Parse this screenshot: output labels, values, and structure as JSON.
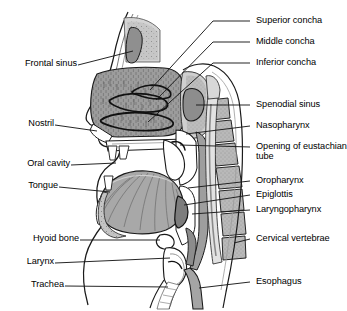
{
  "figure": {
    "type": "anatomical-diagram",
    "colors": {
      "background": "#ffffff",
      "outline": "#1a1a1a",
      "tissue_mid": "#9a9a9a",
      "tissue_dark": "#6e6e6e",
      "tissue_light": "#c8c8c8",
      "cavity_white": "#ffffff",
      "bone_stipple": "#b4b4b4",
      "label_text": "#000000",
      "leader_line": "#1a1a1a"
    }
  },
  "labels": {
    "left": [
      {
        "id": "frontal-sinus",
        "text": "Frontal sinus",
        "x": 14,
        "y": 62
      },
      {
        "id": "nostril",
        "text": "Nostril",
        "x": 14,
        "y": 122
      },
      {
        "id": "oral-cavity",
        "text": "Oral cavity",
        "x": 14,
        "y": 162
      },
      {
        "id": "tongue",
        "text": "Tongue",
        "x": 14,
        "y": 184
      },
      {
        "id": "hyoid-bone",
        "text": "Hyoid bone",
        "x": 14,
        "y": 237
      },
      {
        "id": "larynx",
        "text": "Larynx",
        "x": 14,
        "y": 260
      },
      {
        "id": "trachea",
        "text": "Trachea",
        "x": 14,
        "y": 283
      }
    ],
    "right": [
      {
        "id": "superior-concha",
        "text": "Superior concha",
        "x": 256,
        "y": 22
      },
      {
        "id": "middle-concha",
        "text": "Middle concha",
        "x": 256,
        "y": 43
      },
      {
        "id": "inferior-concha",
        "text": "Inferior concha",
        "x": 256,
        "y": 64
      },
      {
        "id": "spenodial-sinus",
        "text": "Spenodial sinus",
        "x": 256,
        "y": 106
      },
      {
        "id": "nasopharynx",
        "text": "Nasopharynx",
        "x": 256,
        "y": 127
      },
      {
        "id": "eustachian-tube",
        "text": "Opening of eustachian tube",
        "x": 256,
        "y": 148
      },
      {
        "id": "oropharynx",
        "text": "Oropharynx",
        "x": 256,
        "y": 182
      },
      {
        "id": "epiglottis",
        "text": "Epiglottis",
        "x": 256,
        "y": 196
      },
      {
        "id": "laryngopharynx",
        "text": "Laryngopharynx",
        "x": 256,
        "y": 211
      },
      {
        "id": "cervical-vertebrae",
        "text": "Cervical vertebrae",
        "x": 256,
        "y": 240
      },
      {
        "id": "esophagus",
        "text": "Esophagus",
        "x": 256,
        "y": 283
      }
    ]
  }
}
